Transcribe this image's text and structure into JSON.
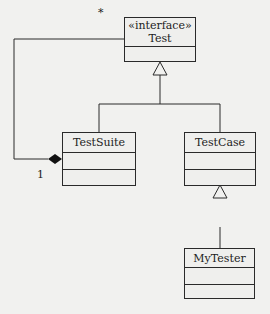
{
  "diagram": {
    "type": "UML class diagram",
    "classes": [
      {
        "id": "test",
        "stereotype": "«interface»",
        "name": "Test"
      },
      {
        "id": "testsuite",
        "name": "TestSuite"
      },
      {
        "id": "testcase",
        "name": "TestCase"
      },
      {
        "id": "mytester",
        "name": "MyTester"
      }
    ],
    "relationships": [
      {
        "from": "testsuite",
        "to": "test",
        "kind": "generalization"
      },
      {
        "from": "testcase",
        "to": "test",
        "kind": "generalization"
      },
      {
        "from": "mytester",
        "to": "testcase",
        "kind": "generalization"
      },
      {
        "from": "testsuite",
        "to": "test",
        "kind": "composition",
        "multiplicity_whole": "1",
        "multiplicity_part": "*"
      }
    ],
    "labels": {
      "many": "*",
      "one": "1"
    }
  }
}
